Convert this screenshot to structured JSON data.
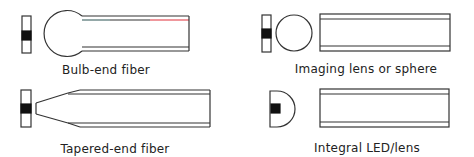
{
  "diagram": {
    "type": "fiber-coupling-methods",
    "panels": [
      {
        "id": "bulb-end",
        "label": "Bulb-end fiber"
      },
      {
        "id": "imaging-lens",
        "label": "Imaging lens or sphere"
      },
      {
        "id": "tapered-end",
        "label": "Tapered-end fiber"
      },
      {
        "id": "integral-led",
        "label": "Integral LED/lens"
      }
    ],
    "colors": {
      "stroke": "#333333",
      "source_fill": "#111111",
      "highlight_red": "#e0303a",
      "highlight_cyan": "#7fd6d6"
    }
  }
}
